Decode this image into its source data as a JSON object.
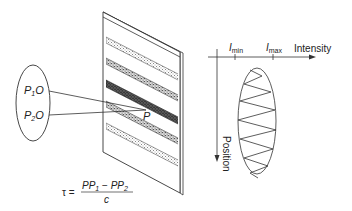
{
  "diagram": {
    "colors": {
      "stroke": "#333333",
      "stripe_light": "#bdbdbd",
      "stripe_dark": "#333333",
      "background": "#ffffff"
    },
    "source": {
      "points": [
        {
          "label_main": "P",
          "label_sub": "1",
          "label_suffix": "O"
        },
        {
          "label_main": "P",
          "label_sub": "2",
          "label_suffix": "O"
        }
      ]
    },
    "screen": {
      "point_label": "P",
      "stripes": [
        {
          "shade": "light"
        },
        {
          "shade": "medium"
        },
        {
          "shade": "dark"
        },
        {
          "shade": "medium"
        },
        {
          "shade": "light"
        }
      ]
    },
    "formula": {
      "lhs": "τ =",
      "numerator_a_main": "PP",
      "numerator_a_sub": "1",
      "minus": "−",
      "numerator_b_main": "PP",
      "numerator_b_sub": "2",
      "denominator": "c"
    },
    "plot": {
      "x_axis_label": "Intensity",
      "y_axis_label": "Position",
      "ticks": [
        {
          "main": "I",
          "sub": "min"
        },
        {
          "main": "I",
          "sub": "max"
        }
      ]
    }
  }
}
